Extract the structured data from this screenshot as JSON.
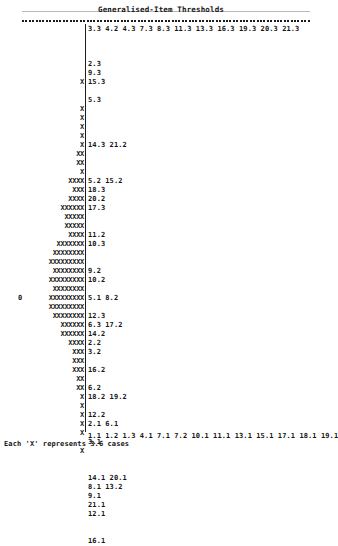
{
  "header": {
    "title": "Generalised-Item Thresholds"
  },
  "chart_data": {
    "type": "bar",
    "title": "Generalised-Item Thresholds",
    "orientation": "horizontal",
    "xlabel": "",
    "ylabel": "",
    "grid": false,
    "legend": "",
    "x_unit_per_symbol": 3.6,
    "symbol": "X",
    "zero_row_marker": "0",
    "top_scale": [
      "3.3",
      "4.2",
      "4.3",
      "7.3",
      "8.3",
      "11.3",
      "13.3",
      "16.3",
      "19.3",
      "20.3",
      "21.3"
    ],
    "bottom_scale": [
      "1.1",
      "1.2",
      "1.3",
      "4.1",
      "7.1",
      "7.2",
      "10.1",
      "11.1",
      "13.1",
      "15.1",
      "17.1",
      "18.1",
      "19.1"
    ],
    "categories": [
      "",
      "",
      "",
      "",
      "",
      "",
      "",
      "",
      "",
      "",
      "",
      "",
      "",
      "",
      "",
      "",
      "",
      "",
      "",
      "",
      "",
      "",
      "",
      "",
      "",
      "",
      "",
      "",
      "",
      "",
      "",
      "",
      "",
      "",
      "",
      "",
      "",
      "",
      "",
      "",
      "",
      "",
      "",
      "",
      ""
    ],
    "rows": [
      {
        "count": 0,
        "labels": "",
        "zero": false
      },
      {
        "count": 0,
        "labels": "",
        "zero": false
      },
      {
        "count": 0,
        "labels": "",
        "zero": false
      },
      {
        "count": 0,
        "labels": "",
        "zero": false
      },
      {
        "count": 0,
        "labels": "2.3",
        "zero": false
      },
      {
        "count": 0,
        "labels": "9.3",
        "zero": false
      },
      {
        "count": 1,
        "labels": "15.3",
        "zero": false
      },
      {
        "count": 0,
        "labels": "",
        "zero": false
      },
      {
        "count": 0,
        "labels": "5.3",
        "zero": false
      },
      {
        "count": 1,
        "labels": "",
        "zero": false
      },
      {
        "count": 1,
        "labels": "",
        "zero": false
      },
      {
        "count": 1,
        "labels": "",
        "zero": false
      },
      {
        "count": 1,
        "labels": "",
        "zero": false
      },
      {
        "count": 1,
        "labels": "14.3 21.2",
        "zero": false
      },
      {
        "count": 2,
        "labels": "",
        "zero": false
      },
      {
        "count": 2,
        "labels": "",
        "zero": false
      },
      {
        "count": 1,
        "labels": "",
        "zero": false
      },
      {
        "count": 4,
        "labels": "5.2 15.2",
        "zero": false
      },
      {
        "count": 3,
        "labels": "18.3",
        "zero": false
      },
      {
        "count": 4,
        "labels": "20.2",
        "zero": false
      },
      {
        "count": 6,
        "labels": "17.3",
        "zero": false
      },
      {
        "count": 5,
        "labels": "",
        "zero": false
      },
      {
        "count": 5,
        "labels": "",
        "zero": false
      },
      {
        "count": 4,
        "labels": "11.2",
        "zero": false
      },
      {
        "count": 7,
        "labels": "10.3",
        "zero": false
      },
      {
        "count": 8,
        "labels": "",
        "zero": false
      },
      {
        "count": 9,
        "labels": "",
        "zero": false
      },
      {
        "count": 8,
        "labels": "9.2",
        "zero": false
      },
      {
        "count": 9,
        "labels": "10.2",
        "zero": false
      },
      {
        "count": 8,
        "labels": "",
        "zero": false
      },
      {
        "count": 9,
        "labels": "5.1 8.2",
        "zero": true
      },
      {
        "count": 9,
        "labels": "",
        "zero": false
      },
      {
        "count": 8,
        "labels": "12.3",
        "zero": false
      },
      {
        "count": 6,
        "labels": "6.3 17.2",
        "zero": false
      },
      {
        "count": 6,
        "labels": "14.2",
        "zero": false
      },
      {
        "count": 4,
        "labels": "2.2",
        "zero": false
      },
      {
        "count": 3,
        "labels": "3.2",
        "zero": false
      },
      {
        "count": 3,
        "labels": "",
        "zero": false
      },
      {
        "count": 3,
        "labels": "16.2",
        "zero": false
      },
      {
        "count": 2,
        "labels": "",
        "zero": false
      },
      {
        "count": 2,
        "labels": "6.2",
        "zero": false
      },
      {
        "count": 1,
        "labels": "18.2 19.2",
        "zero": false
      },
      {
        "count": 1,
        "labels": "",
        "zero": false
      },
      {
        "count": 1,
        "labels": "12.2",
        "zero": false
      },
      {
        "count": 1,
        "labels": "2.1 6.1",
        "zero": false
      },
      {
        "count": 1,
        "labels": "",
        "zero": false
      },
      {
        "count": 0,
        "labels": "3.1",
        "zero": false
      },
      {
        "count": 1,
        "labels": "",
        "zero": false
      },
      {
        "count": 0,
        "labels": "",
        "zero": false
      },
      {
        "count": 0,
        "labels": "",
        "zero": false
      },
      {
        "count": 0,
        "labels": "14.1 20.1",
        "zero": false
      },
      {
        "count": 0,
        "labels": "8.1 13.2",
        "zero": false
      },
      {
        "count": 0,
        "labels": "9.1",
        "zero": false
      },
      {
        "count": 0,
        "labels": "21.1",
        "zero": false
      },
      {
        "count": 0,
        "labels": "12.1",
        "zero": false
      },
      {
        "count": 0,
        "labels": "",
        "zero": false
      },
      {
        "count": 0,
        "labels": "",
        "zero": false
      },
      {
        "count": 0,
        "labels": "16.1",
        "zero": false
      }
    ]
  },
  "footer": {
    "text": "Each 'X' represents   3.6 cases"
  }
}
